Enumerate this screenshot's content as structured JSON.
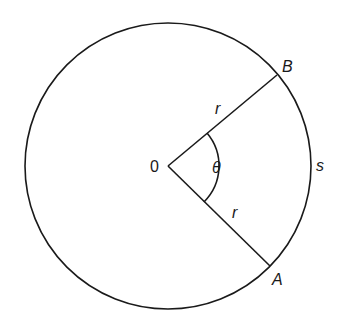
{
  "diagram": {
    "colors": {
      "stroke": "#1a1a1a",
      "background": "#ffffff"
    },
    "circle": {
      "cx": 168,
      "cy": 166,
      "r": 143
    },
    "points": {
      "center": {
        "label": "0",
        "x": 168,
        "y": 166
      },
      "B": {
        "label": "B",
        "x": 277,
        "y": 75
      },
      "A": {
        "label": "A",
        "x": 270,
        "y": 266
      }
    },
    "labels": {
      "radius_upper": "r",
      "radius_lower": "r",
      "angle": "θ",
      "arc": "s",
      "point_B": "B",
      "point_A": "A",
      "center": "0"
    }
  }
}
